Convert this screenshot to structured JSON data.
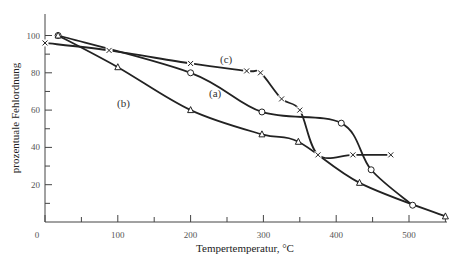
{
  "chart_data": {
    "type": "line",
    "title": "",
    "xlabel": "Tempertemperatur, °C",
    "ylabel": "prozentuale Fehlordnung",
    "xlim": [
      0,
      550
    ],
    "ylim": [
      0,
      110
    ],
    "x_ticks": [
      0,
      100,
      200,
      300,
      400,
      500
    ],
    "x_minor_ticks": [
      50,
      150,
      250,
      350,
      450,
      550
    ],
    "y_ticks": [
      20,
      40,
      60,
      80,
      100
    ],
    "y_minor_ticks": [
      10,
      30,
      50,
      70,
      90
    ],
    "grid": false,
    "legend": "inline curve labels",
    "series": [
      {
        "name": "(a)",
        "marker": "circle",
        "label_pos": [
          235,
          63
        ],
        "x": [
          18,
          200,
          298,
          407,
          448,
          505
        ],
        "y": [
          100,
          80,
          59,
          53,
          28,
          9
        ]
      },
      {
        "name": "(b)",
        "marker": "triangle",
        "label_pos": [
          110,
          56
        ],
        "x": [
          18,
          100,
          200,
          298,
          348,
          432,
          550
        ],
        "y": [
          100,
          83,
          60,
          47,
          43,
          21,
          3
        ]
      },
      {
        "name": "(c)",
        "marker": "x",
        "label_pos": [
          247,
          88
        ],
        "x": [
          0,
          88,
          200,
          277,
          296,
          325,
          350,
          375,
          423,
          475
        ],
        "y": [
          96,
          92,
          85,
          81,
          80,
          66,
          60,
          36,
          36,
          36
        ]
      }
    ]
  },
  "axes": {
    "x_label": "Tempertemperatur, °C",
    "y_label": "prozentuale Fehlordnung",
    "x_tick_labels": [
      "0",
      "100",
      "200",
      "300",
      "400",
      "500"
    ],
    "y_tick_labels": [
      "20",
      "40",
      "60",
      "80",
      "100"
    ]
  },
  "labels": {
    "a": "(a)",
    "b": "(b)",
    "c": "(c)"
  }
}
